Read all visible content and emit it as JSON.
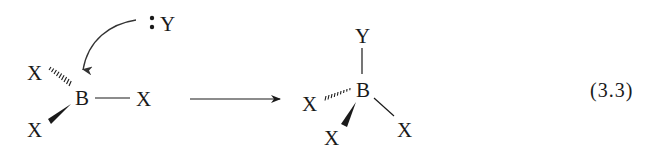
{
  "equation_label": "(3.3)",
  "reactant": {
    "center_atom": "B",
    "substituents": {
      "hashed": "X",
      "plain": "X",
      "wedged": "X"
    },
    "nucleophile": {
      "lone_pair": ":",
      "atom": "Y"
    }
  },
  "product": {
    "center_atom": "B",
    "substituents": {
      "top": "Y",
      "hashed": "X",
      "wedged": "X",
      "plain": "X"
    }
  },
  "arrows": {
    "electron_push": "curved arrow from Y lone pair to B",
    "reaction": "forward reaction arrow"
  },
  "colors": {
    "ink": "#1a1a1a",
    "background": "#ffffff"
  }
}
